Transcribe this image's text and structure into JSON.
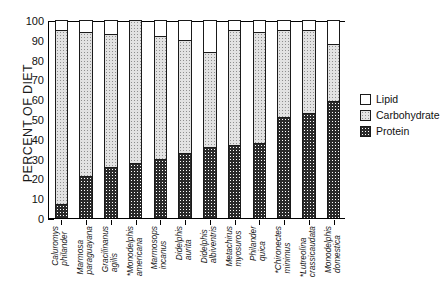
{
  "chart_data": {
    "type": "bar",
    "subtype": "stacked-vertical",
    "title": "",
    "xlabel": "",
    "ylabel": "PERCENT OF DIET",
    "ylim": [
      0,
      100
    ],
    "yticks": [
      0,
      10,
      20,
      30,
      40,
      50,
      60,
      70,
      80,
      90,
      100
    ],
    "grid": false,
    "legend_position": "right",
    "legend": [
      "Lipid",
      "Carbohydrate",
      "Protein"
    ],
    "categories": [
      "Caluromys philander",
      "Marmosa paraguayana",
      "Gracilinanus agilis",
      "*Monodelphis americana",
      "Marmosops incanus",
      "Didelphis aurita",
      "Didelphis albiventris",
      "Metachirus myosuros",
      "Philander quica",
      "*Chironectes minimus",
      "*Lutreolina crassicaudata",
      "Monodelphis domestica"
    ],
    "category_lines": [
      [
        "Caluromys",
        "philander"
      ],
      [
        "Marmosa",
        "paraguayana"
      ],
      [
        "Gracilinanus",
        "agilis"
      ],
      [
        "*Monodelphis",
        "americana"
      ],
      [
        "Marmosops",
        "incanus"
      ],
      [
        "Didelphis",
        "aurita"
      ],
      [
        "Didelphis",
        "albiventris"
      ],
      [
        "Metachirus",
        "myosuros"
      ],
      [
        "Philander",
        "quica"
      ],
      [
        "*Chironectes",
        "minimus"
      ],
      [
        "*Lutreolina",
        "crassicaudata"
      ],
      [
        "Monodelphis",
        "domestica"
      ]
    ],
    "series": [
      {
        "name": "Protein",
        "values": [
          7,
          21,
          26,
          28,
          30,
          33,
          36,
          37,
          38,
          51,
          53,
          59
        ]
      },
      {
        "name": "Carbohydrate",
        "values": [
          88,
          73,
          67,
          72,
          62,
          57,
          48,
          58,
          56,
          44,
          42,
          29
        ]
      },
      {
        "name": "Lipid",
        "values": [
          5,
          6,
          7,
          0,
          8,
          10,
          16,
          5,
          6,
          5,
          5,
          12
        ]
      }
    ],
    "stack_tops": {
      "protein": [
        7,
        21,
        26,
        28,
        30,
        33,
        36,
        37,
        38,
        51,
        53,
        59
      ],
      "protein_plus_carb": [
        95,
        94,
        93,
        100,
        92,
        90,
        84,
        95,
        94,
        95,
        95,
        88
      ],
      "total": [
        100,
        100,
        100,
        100,
        100,
        100,
        100,
        100,
        100,
        100,
        100,
        100
      ]
    }
  },
  "legend": {
    "items": [
      {
        "label": "Lipid",
        "swatch": "sw-lipid"
      },
      {
        "label": "Carbohydrate",
        "swatch": "sw-carb"
      },
      {
        "label": "Protein",
        "swatch": "sw-prot"
      }
    ]
  },
  "colors": {
    "lipid": "#ffffff",
    "carbohydrate": "#e2e2e2",
    "protein": "#2a2a2a",
    "axis": "#000000"
  }
}
